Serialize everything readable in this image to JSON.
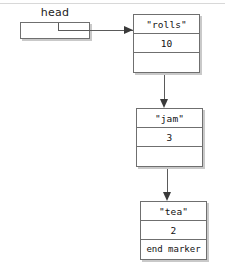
{
  "diagram": {
    "head": {
      "label": "head",
      "value": ""
    },
    "nodes": [
      {
        "id": "node1",
        "data": "\"rolls\"",
        "count": "10",
        "next": ""
      },
      {
        "id": "node2",
        "data": "\"jam\"",
        "count": "3",
        "next": ""
      },
      {
        "id": "node3",
        "data": "\"tea\"",
        "count": "2",
        "next": "end marker"
      }
    ],
    "arrows": [
      {
        "name": "head-to-node1",
        "direction": "right"
      },
      {
        "name": "node1-to-node2",
        "direction": "down"
      },
      {
        "name": "node2-to-node3",
        "direction": "down"
      }
    ],
    "colors": {
      "box_border": "#6f6f6f",
      "box_shadow": "#c9c9c9",
      "connector": "#5a5a5a",
      "arrowhead": "#3a3a3a",
      "background": "#ffffff",
      "top_rule": "#d8d8d8"
    }
  }
}
